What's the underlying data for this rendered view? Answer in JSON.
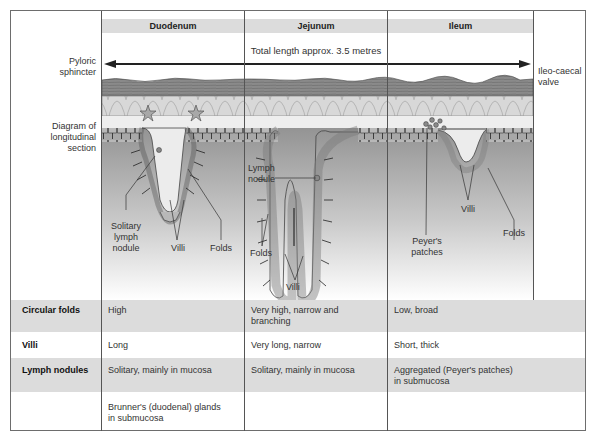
{
  "header": {
    "columns": [
      "Duodenum",
      "Jejunum",
      "Ileum"
    ]
  },
  "diagram": {
    "length_label": "Total length approx. 3.5 metres",
    "left_labels": {
      "pyloric": [
        "Pyloric",
        "sphincter"
      ],
      "section": [
        "Diagram of",
        "longitudinal",
        "section"
      ]
    },
    "right_label": [
      "Ileo-caecal",
      "valve"
    ],
    "duodenum_labels": {
      "solitary": [
        "Solitary",
        "lymph",
        "nodule"
      ],
      "villi": "Villi",
      "folds": "Folds"
    },
    "jejunum_labels": {
      "lymph": [
        "Lymph",
        "nodule"
      ],
      "folds": "Folds",
      "villi": "Villi"
    },
    "ileum_labels": {
      "peyers": [
        "Peyer's",
        "patches"
      ],
      "villi": "Villi",
      "folds": "Folds"
    },
    "colors": {
      "muscle": "#8a8a8a",
      "submucosa": "#d6d6d6",
      "mucosa_top": "#9a9a9a",
      "mucosa_fade": "#ffffff",
      "villi": "#b0b0b0",
      "outline": "#444444"
    }
  },
  "table": {
    "rows": [
      {
        "label": "Circular folds",
        "duodenum": "High",
        "jejunum": [
          "Very high, narrow and",
          "branching"
        ],
        "ileum": "Low, broad",
        "shaded": true
      },
      {
        "label": "Villi",
        "duodenum": "Long",
        "jejunum": "Very long, narrow",
        "ileum": "Short, thick",
        "shaded": false
      },
      {
        "label": "Lymph nodules",
        "duodenum": "Solitary, mainly in mucosa",
        "jejunum": "Solitary, mainly in mucosa",
        "ileum": [
          "Aggregated (Peyer's patches)",
          "in submucosa"
        ],
        "shaded": true
      },
      {
        "label": "",
        "duodenum": [
          "Brunner's (duodenal) glands",
          "in submucosa"
        ],
        "jejunum": "",
        "ileum": "",
        "shaded": false
      }
    ]
  }
}
